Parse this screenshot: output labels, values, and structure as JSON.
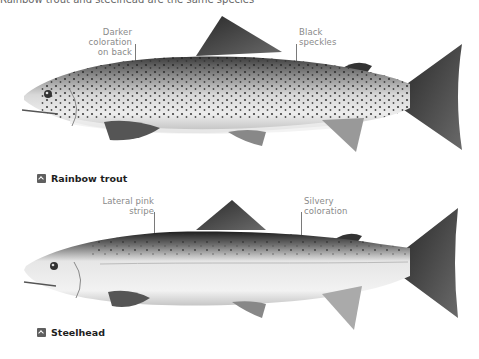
{
  "top_partial_text": "Rainbow trout and steelhead are the same species",
  "fish": [
    {
      "id": "rainbow-trout",
      "caption": "Rainbow trout",
      "annotations": [
        {
          "id": "darker-coloration",
          "lines": [
            "Darker coloration",
            "on back"
          ]
        },
        {
          "id": "black-speckles",
          "lines": [
            "Black",
            "speckles"
          ]
        }
      ]
    },
    {
      "id": "steelhead",
      "caption": "Steelhead",
      "annotations": [
        {
          "id": "lateral-pink-stripe",
          "lines": [
            "Lateral pink",
            "stripe"
          ]
        },
        {
          "id": "silvery-coloration",
          "lines": [
            "Silvery",
            "coloration"
          ]
        }
      ]
    }
  ],
  "colors": {
    "label_text": "#8a8a8a",
    "caption_text": "#1e1e1e",
    "icon_bg": "#5f5f5f"
  }
}
